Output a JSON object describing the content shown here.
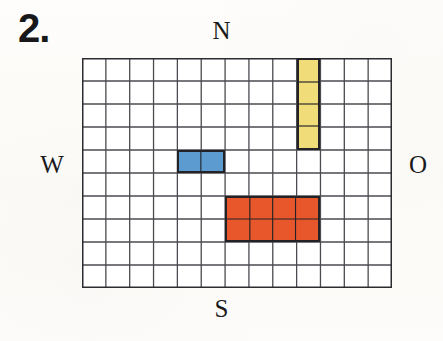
{
  "exercise": {
    "number_label": "2."
  },
  "compass": {
    "north": "N",
    "east": "O",
    "south": "S",
    "west": "W"
  },
  "grid": {
    "columns": 13,
    "rows": 10,
    "line_color": "#4a4a50",
    "background_color": "#ffffff",
    "outline_color": "#2c2c30"
  },
  "shapes": [
    {
      "name": "yellow-rectangle",
      "color": "#f0dd7a",
      "outline_color": "#232226",
      "col": 10,
      "row": 1,
      "width_cells": 1,
      "height_cells": 4,
      "area_cells": 4
    },
    {
      "name": "blue-rectangle",
      "color": "#5b9bd0",
      "outline_color": "#232226",
      "col": 5,
      "row": 5,
      "width_cells": 2,
      "height_cells": 1,
      "area_cells": 2
    },
    {
      "name": "red-rectangle",
      "color": "#e8572c",
      "outline_color": "#232226",
      "col": 7,
      "row": 7,
      "width_cells": 4,
      "height_cells": 2,
      "area_cells": 8
    }
  ],
  "page": {
    "background_color": "#fdfcfa"
  }
}
